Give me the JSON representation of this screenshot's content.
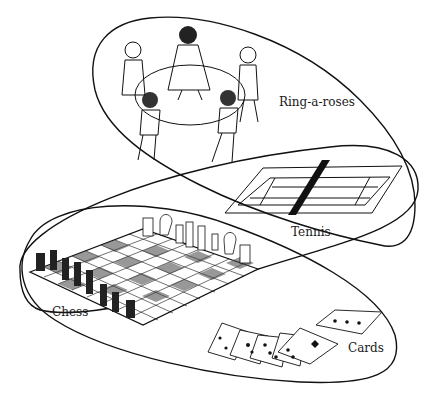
{
  "diagram": {
    "type": "overlapping-family-resemblance-loops",
    "labels": {
      "ring": "Ring-a-roses",
      "tennis": "Tennis",
      "chess": "Chess",
      "cards": "Cards"
    },
    "groups": [
      {
        "name": "loop-1",
        "contains": [
          "Ring-a-roses",
          "Tennis"
        ]
      },
      {
        "name": "loop-2",
        "contains": [
          "Tennis",
          "Chess"
        ]
      },
      {
        "name": "loop-3",
        "contains": [
          "Chess",
          "Cards"
        ]
      }
    ],
    "colors": {
      "ink": "#111111",
      "background": "#ffffff"
    }
  }
}
